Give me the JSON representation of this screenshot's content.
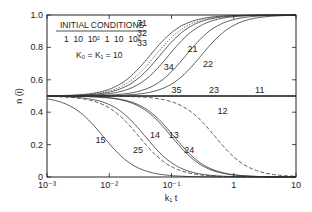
{
  "chart_data": {
    "type": "line",
    "title": "",
    "xlabel": "k₁ t",
    "ylabel": "n (i)",
    "xscale": "log",
    "xlim": [
      0.001,
      10
    ],
    "ylim": [
      0,
      1.0
    ],
    "x_ticks": [
      "10⁻³",
      "10⁻²",
      "10⁻¹",
      "1",
      "10"
    ],
    "y_ticks": [
      "0",
      "0.2",
      "0.4",
      "0.6",
      "0.8",
      "1.0"
    ],
    "grid": false,
    "legend": {
      "title": "INITIAL CONDITIONS",
      "row": "1  10  10²  1  10  10²",
      "params": "K₀ = K₁ = 10",
      "position": "upper-left"
    },
    "series": [
      {
        "name": "31",
        "direction": "rise",
        "midpoint_x": 0.045,
        "steepness": 1.6,
        "style": "solid"
      },
      {
        "name": "32",
        "direction": "rise",
        "midpoint_x": 0.055,
        "steepness": 1.6,
        "style": "dotted"
      },
      {
        "name": "33",
        "direction": "rise",
        "midpoint_x": 0.065,
        "steepness": 1.6,
        "style": "solid"
      },
      {
        "name": "34",
        "direction": "rise",
        "midpoint_x": 0.09,
        "steepness": 1.6,
        "style": "solid"
      },
      {
        "name": "21",
        "direction": "rise",
        "midpoint_x": 0.17,
        "steepness": 1.6,
        "style": "solid"
      },
      {
        "name": "22",
        "direction": "rise",
        "midpoint_x": 0.3,
        "steepness": 1.6,
        "style": "solid"
      },
      {
        "name": "35",
        "direction": "flat",
        "value": 0.5,
        "style": "solid"
      },
      {
        "name": "23",
        "direction": "flat",
        "value": 0.5,
        "style": "solid"
      },
      {
        "name": "11",
        "direction": "flat",
        "value": 0.5,
        "style": "solid"
      },
      {
        "name": "15",
        "direction": "fall",
        "midpoint_x": 0.008,
        "steepness": 1.6,
        "style": "solid"
      },
      {
        "name": "25",
        "direction": "fall",
        "midpoint_x": 0.03,
        "steepness": 1.6,
        "style": "dashed"
      },
      {
        "name": "14",
        "direction": "fall",
        "midpoint_x": 0.038,
        "steepness": 1.6,
        "style": "solid"
      },
      {
        "name": "13",
        "direction": "fall",
        "midpoint_x": 0.1,
        "steepness": 1.6,
        "style": "solid"
      },
      {
        "name": "24",
        "direction": "fall",
        "midpoint_x": 0.11,
        "steepness": 1.6,
        "style": "solid"
      },
      {
        "name": "12",
        "direction": "fall",
        "midpoint_x": 0.5,
        "steepness": 1.6,
        "style": "dashed"
      }
    ],
    "labels": [
      {
        "text": "31",
        "x": 0.028,
        "y": 0.93
      },
      {
        "text": "32",
        "x": 0.028,
        "y": 0.87
      },
      {
        "text": "33",
        "x": 0.028,
        "y": 0.81
      },
      {
        "text": "34",
        "x": 0.075,
        "y": 0.66
      },
      {
        "text": "21",
        "x": 0.18,
        "y": 0.77
      },
      {
        "text": "22",
        "x": 0.32,
        "y": 0.68
      },
      {
        "text": "35",
        "x": 0.1,
        "y": 0.52
      },
      {
        "text": "23",
        "x": 0.4,
        "y": 0.52
      },
      {
        "text": "11",
        "x": 2.2,
        "y": 0.52
      },
      {
        "text": "15",
        "x": 0.006,
        "y": 0.21
      },
      {
        "text": "25",
        "x": 0.024,
        "y": 0.15
      },
      {
        "text": "14",
        "x": 0.045,
        "y": 0.24
      },
      {
        "text": "13",
        "x": 0.09,
        "y": 0.24
      },
      {
        "text": "24",
        "x": 0.16,
        "y": 0.15
      },
      {
        "text": "12",
        "x": 0.55,
        "y": 0.39
      }
    ]
  }
}
